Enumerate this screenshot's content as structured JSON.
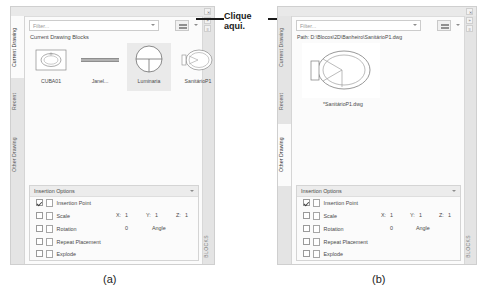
{
  "figure": {
    "caption_a": "(a)",
    "caption_b": "(b)",
    "callout_text": "Clique aqui."
  },
  "panel_a": {
    "tabs": [
      {
        "label": "Current Drawing",
        "active": true
      },
      {
        "label": "Recent",
        "active": false
      },
      {
        "label": "Other Drawing",
        "active": false
      }
    ],
    "right_rail_label": "BLOCKS",
    "filter": {
      "placeholder": "Filter...",
      "value": ""
    },
    "view_button": "view-options-icon",
    "section_title": "Current Drawing Blocks",
    "blocks": [
      {
        "name": "CUBA01",
        "icon": "sink-block",
        "selected": false
      },
      {
        "name": "Janel...",
        "icon": "window-block",
        "selected": false
      },
      {
        "name": "Luminaria",
        "icon": "luminaire-block",
        "selected": true
      },
      {
        "name": "SanitárioP1",
        "icon": "toilet-block",
        "selected": false
      }
    ],
    "insertion_options": {
      "title": "Insertion Options",
      "rows": [
        {
          "label": "Insertion Point",
          "checked": true
        },
        {
          "label": "Scale",
          "checked": false
        },
        {
          "label": "Rotation",
          "checked": false
        },
        {
          "label": "Repeat Placement",
          "checked": false
        },
        {
          "label": "Explode",
          "checked": false
        }
      ],
      "scale_x_label": "X:",
      "scale_x_value": "1",
      "scale_y_label": "Y:",
      "scale_y_value": "1",
      "scale_z_label": "Z:",
      "scale_z_value": "1",
      "rotation_value": "0",
      "angle_label": "Angle"
    }
  },
  "panel_b": {
    "tabs": [
      {
        "label": "Current Drawing",
        "active": false
      },
      {
        "label": "Recent",
        "active": false
      },
      {
        "label": "Other Drawing",
        "active": true
      }
    ],
    "right_rail_label": "BLOCKS",
    "filter": {
      "placeholder": "Filter...",
      "value": ""
    },
    "view_button": "view-options-icon",
    "path_text": "Path: D:\\Blocos\\2D\\Banheiro\\SanitárioP1.dwg",
    "preview_label": "*SanitárioP1.dwg",
    "preview_icon": "toilet-block",
    "insertion_options": {
      "title": "Insertion Options",
      "rows": [
        {
          "label": "Insertion Point",
          "checked": true
        },
        {
          "label": "Scale",
          "checked": false
        },
        {
          "label": "Rotation",
          "checked": false
        },
        {
          "label": "Repeat Placement",
          "checked": false
        },
        {
          "label": "Explode",
          "checked": false
        }
      ],
      "scale_x_label": "X:",
      "scale_x_value": "1",
      "scale_y_label": "Y:",
      "scale_y_value": "1",
      "scale_z_label": "Z:",
      "scale_z_value": "1",
      "rotation_value": "0",
      "angle_label": "Angle"
    }
  },
  "window_controls": {
    "close": "✕",
    "collapse": "»",
    "menu": "≡"
  }
}
